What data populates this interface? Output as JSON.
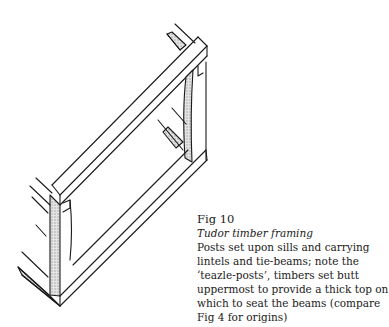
{
  "figure": {
    "number": "Fig 10",
    "title": "Tudor timber framing",
    "description": "Posts set upon sills and carrying lintels and tie-beams; note the ‘teazle-posts’, timbers set butt uppermost to provide a thick top on which to seat the beams (compare Fig 4 for origins)"
  },
  "colors": {
    "ink": "#1a1a1a",
    "shading": "#cfcfcf",
    "background": "#ffffff"
  }
}
